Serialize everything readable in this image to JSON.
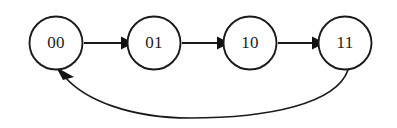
{
  "diagram": {
    "type": "state-transition-diagram",
    "canvas": {
      "width": 397,
      "height": 128,
      "background": "#ffffff"
    },
    "style": {
      "node_fill": "#ffffff",
      "node_stroke": "#1a1a1a",
      "node_stroke_width": 1.9,
      "edge_color": "#1a1a1a",
      "edge_width": 1.9,
      "arrow_fill": "#121212",
      "label_color": "#1b1b1b",
      "label_font_size": "17px"
    },
    "nodes": [
      {
        "id": "n0",
        "label": "00",
        "cx": 56,
        "cy": 43,
        "r": 26.5
      },
      {
        "id": "n1",
        "label": "01",
        "cx": 154,
        "cy": 43,
        "r": 26.5
      },
      {
        "id": "n2",
        "label": "10",
        "cx": 250,
        "cy": 43,
        "r": 26.5
      },
      {
        "id": "n3",
        "label": "11",
        "cx": 345,
        "cy": 43,
        "r": 26.5
      }
    ],
    "edges": [
      {
        "id": "e0",
        "from": "00",
        "to": "01",
        "shape": "straight",
        "label": "",
        "path": "M 84 43 L 121 43",
        "arrow": "M 121 36.4 L 134 43 L 121 49.6 Z"
      },
      {
        "id": "e1",
        "from": "01",
        "to": "10",
        "shape": "straight",
        "label": "",
        "path": "M 182 43 L 217 43",
        "arrow": "M 217 36.4 L 230 43 L 217 49.6 Z"
      },
      {
        "id": "e2",
        "from": "10",
        "to": "11",
        "shape": "straight",
        "label": "",
        "path": "M 278 43 L 312 43",
        "arrow": "M 312 36.4 L 325 43 L 312 49.6 Z"
      },
      {
        "id": "e3",
        "from": "11",
        "to": "00",
        "shape": "curved-feedback",
        "label": "",
        "path": "M 348 70 C 336 104 268 118 190 118 C 130 118 85 100 65 77",
        "arrow": "M 56 67 L 74 77 L 63 80 Z"
      }
    ]
  }
}
